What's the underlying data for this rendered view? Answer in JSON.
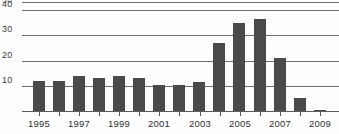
{
  "chart_data": {
    "type": "bar",
    "title": "",
    "subtitle": "",
    "xlabel": "",
    "ylabel": "",
    "categories": [
      "1995",
      "1996",
      "1997",
      "1998",
      "1999",
      "2000",
      "2001",
      "2002",
      "2003",
      "2004",
      "2005",
      "2006",
      "2007",
      "2008",
      "2009"
    ],
    "values": [
      12,
      12,
      14,
      13,
      14,
      13,
      10.5,
      10.5,
      11.5,
      27,
      35,
      36.5,
      21,
      5,
      0.5
    ],
    "series": [
      {
        "name": "count",
        "values": [
          12,
          12,
          14,
          13,
          14,
          13,
          10.5,
          10.5,
          11.5,
          27,
          35,
          36.5,
          21,
          5,
          0.5
        ]
      }
    ],
    "ylim": [
      0,
      44
    ],
    "yticks": [
      10,
      20,
      30,
      40
    ],
    "ytick_labels": [
      "10",
      "20",
      "30",
      "40"
    ],
    "ytick_clipped_top": "50",
    "xtick_labels": [
      "1995",
      "1997",
      "1999",
      "2001",
      "2003",
      "2005",
      "2007",
      "2009"
    ],
    "xtick_label_years": [
      1995,
      1997,
      1999,
      2001,
      2003,
      2005,
      2007,
      2009
    ],
    "grid": true,
    "legend": false,
    "legend_position": "none",
    "bar_color": "#4a4a4a",
    "gridline_color": "#6e6e6e",
    "axis_color": "#5a5a5a",
    "background_color": "#fefefe"
  }
}
